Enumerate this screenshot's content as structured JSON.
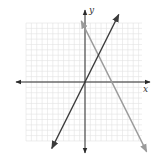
{
  "chart_data": {
    "type": "line",
    "title": "",
    "xlabel": "x",
    "ylabel": "y",
    "xlim": [
      -11,
      11
    ],
    "ylim": [
      -11,
      11
    ],
    "grid": true,
    "grid_step": 1,
    "tick_labels": false,
    "series": [
      {
        "name": "line-1",
        "equation": "y = 2x",
        "color": "#3a3a3a",
        "points": [
          [
            -6.2,
            -12.4
          ],
          [
            6.3,
            12.6
          ]
        ]
      },
      {
        "name": "line-2",
        "equation": "y = -2x + 10",
        "color": "#9a9a9a",
        "points": [
          [
            -0.7,
            11.4
          ],
          [
            11.5,
            -13.0
          ]
        ]
      }
    ],
    "intersection": [
      2.5,
      5
    ]
  },
  "labels": {
    "x_axis": "x",
    "y_axis": "y"
  },
  "colors": {
    "grid": "#e2e2e2",
    "axis": "#2a2a2a",
    "line_dark": "#3a3a3a",
    "line_light": "#9a9a9a"
  }
}
